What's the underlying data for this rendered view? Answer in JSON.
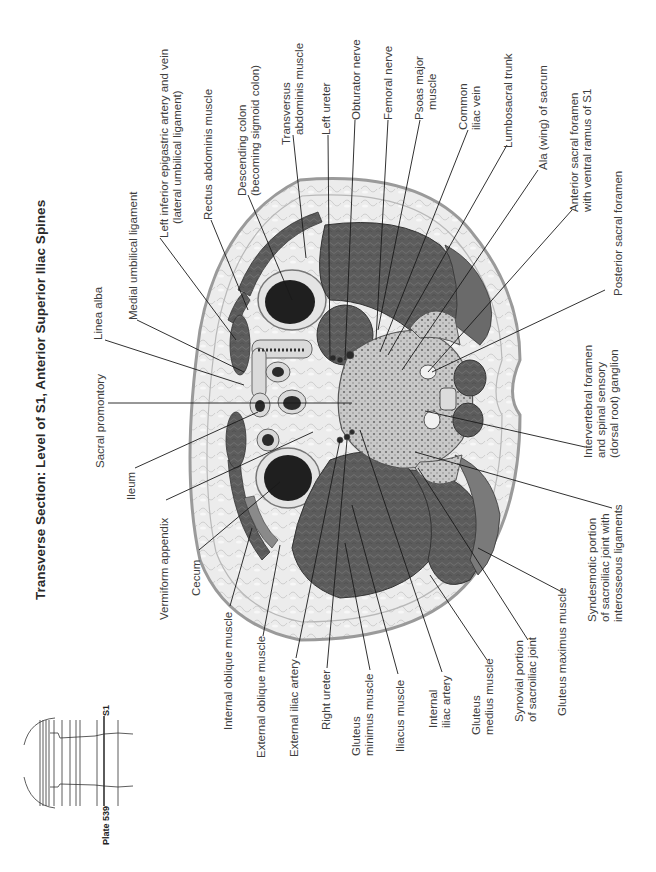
{
  "title": "Transverse Section: Level of S1, Anterior Superior Iliac Spines",
  "orientation_note": "Page content rotated 90° counter-clockwise",
  "inset": {
    "plate_label": "Plate 539",
    "level_label": "S1"
  },
  "labels_top": [
    {
      "id": "medial-umbilical-ligament",
      "lines": [
        "Medial umbilical ligament"
      ]
    },
    {
      "id": "left-inferior-epigastric",
      "lines": [
        "Left inferior epigastric artery and vein",
        "(lateral umbilical ligament)"
      ]
    },
    {
      "id": "rectus-abdominis",
      "lines": [
        "Rectus abdominis muscle"
      ]
    },
    {
      "id": "descending-colon",
      "lines": [
        "Descending colon",
        "(becoming sigmoid colon)"
      ]
    },
    {
      "id": "transversus-abdominis",
      "lines": [
        "Transversus",
        "abdominis muscle"
      ]
    },
    {
      "id": "left-ureter",
      "lines": [
        "Left ureter"
      ]
    },
    {
      "id": "obturator-nerve",
      "lines": [
        "Obturator nerve"
      ]
    },
    {
      "id": "femoral-nerve",
      "lines": [
        "Femoral nerve"
      ]
    },
    {
      "id": "psoas-major",
      "lines": [
        "Psoas major",
        "muscle"
      ]
    },
    {
      "id": "common-iliac-vein",
      "lines": [
        "Common",
        "iliac vein"
      ]
    },
    {
      "id": "lumbosacral-trunk",
      "lines": [
        "Lumbosacral trunk"
      ]
    },
    {
      "id": "ala-of-sacrum",
      "lines": [
        "Ala (wing) of sacrum"
      ]
    },
    {
      "id": "anterior-sacral-foramen",
      "lines": [
        "Anterior sacral foramen",
        "with ventral ramus of S1"
      ]
    },
    {
      "id": "posterior-sacral-foramen",
      "lines": [
        "Posterior sacral foramen"
      ]
    }
  ],
  "labels_left": [
    {
      "id": "linea-alba",
      "lines": [
        "Linea alba"
      ]
    },
    {
      "id": "sacral-promontory",
      "lines": [
        "Sacral promontory"
      ]
    },
    {
      "id": "ileum",
      "lines": [
        "Ileum"
      ]
    },
    {
      "id": "vermiform-appendix",
      "lines": [
        "Vermiform appendix"
      ]
    },
    {
      "id": "cecum",
      "lines": [
        "Cecum"
      ]
    }
  ],
  "labels_right": [
    {
      "id": "intervertebral-foramen",
      "lines": [
        "Intervertebral foramen",
        "and spinal sensory",
        "(dorsal root) ganglion"
      ]
    },
    {
      "id": "syndesmotic-portion",
      "lines": [
        "Syndesmotic portion",
        "of sacroiliac joint with",
        "interosseous ligaments"
      ]
    }
  ],
  "labels_bottom": [
    {
      "id": "internal-oblique",
      "lines": [
        "Internal oblique muscle"
      ]
    },
    {
      "id": "external-oblique",
      "lines": [
        "External oblique muscle"
      ]
    },
    {
      "id": "external-iliac-artery",
      "lines": [
        "External iliac artery"
      ]
    },
    {
      "id": "right-ureter",
      "lines": [
        "Right ureter"
      ]
    },
    {
      "id": "gluteus-minimus",
      "lines": [
        "Gluteus",
        "minimus muscle"
      ]
    },
    {
      "id": "iliacus",
      "lines": [
        "Iliacus muscle"
      ]
    },
    {
      "id": "internal-iliac-artery",
      "lines": [
        "Internal",
        "iliac artery"
      ]
    },
    {
      "id": "gluteus-medius",
      "lines": [
        "Gluteus",
        "medius muscle"
      ]
    },
    {
      "id": "synovial-portion",
      "lines": [
        "Synovial portion",
        "of sacroiliac joint"
      ]
    },
    {
      "id": "gluteus-maximus",
      "lines": [
        "Gluteus maximus muscle"
      ]
    }
  ],
  "colors": {
    "background": "#ffffff",
    "skin_fat": "#e9e9e9",
    "skin_outline": "#9a9a9a",
    "muscle": "#5a5a5a",
    "muscle_dark": "#3c3c3c",
    "bone": "#bdbdbd",
    "lumen": "#1e1e1e",
    "leader_line": "#1a1a1a",
    "text": "#3d3d3d"
  }
}
